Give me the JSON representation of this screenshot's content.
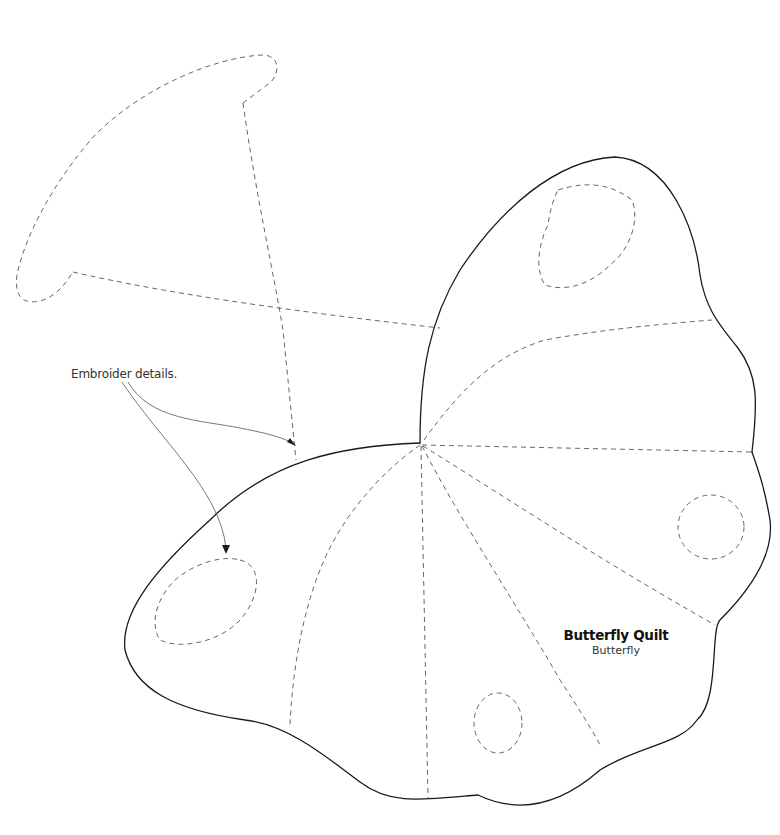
{
  "diagram": {
    "type": "sewing-pattern-template",
    "annotation": {
      "text": "Embroider details.",
      "targets": [
        "upper-wing-piece-stitch-line",
        "lower-wing-left-oval"
      ]
    },
    "title_block": {
      "title": "Butterfly Quilt",
      "subtitle": "Butterfly"
    },
    "pieces": [
      {
        "name": "upper-left-wing-ghost",
        "outline": "dashed",
        "note": "placement guide for mirrored wing"
      },
      {
        "name": "upper-right-wing",
        "outline": "solid",
        "embroidery": [
          "oval"
        ]
      },
      {
        "name": "lower-wing",
        "outline": "solid",
        "embroidery": [
          "oval",
          "circle",
          "circle"
        ]
      }
    ],
    "colors": {
      "cut_line": "#1a1a1a",
      "stitch_line": "#555555",
      "background": "#ffffff"
    }
  }
}
